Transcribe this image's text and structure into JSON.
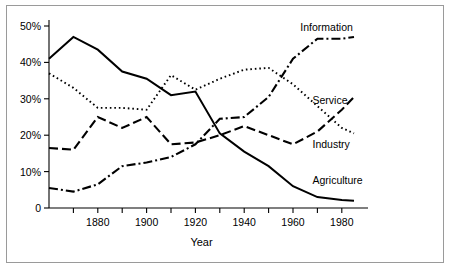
{
  "figure": {
    "border_color": "#9a9a9a",
    "background": "#ffffff"
  },
  "chart_data": {
    "type": "line",
    "title": "",
    "subtitle": "",
    "xlabel": "Year",
    "ylabel": "",
    "xlim": [
      1860,
      1985
    ],
    "ylim": [
      0,
      50
    ],
    "grid": false,
    "legend_position": "right-inline-labels",
    "x": [
      1860,
      1870,
      1880,
      1890,
      1900,
      1910,
      1920,
      1930,
      1940,
      1950,
      1960,
      1970,
      1980,
      1985
    ],
    "xticks": [
      1880,
      1900,
      1920,
      1940,
      1960,
      1980
    ],
    "xtick_labels": [
      "1880",
      "1900",
      "1920",
      "1940",
      "1960",
      "1980"
    ],
    "xminor_tick_interval": 10,
    "yticks": [
      0,
      10,
      20,
      30,
      40,
      50
    ],
    "ytick_labels": [
      "0",
      "10%",
      "20%",
      "30%",
      "40%",
      "50%"
    ],
    "series": [
      {
        "name": "Agriculture",
        "label": "Agriculture",
        "line_style": "solid",
        "color": "#000000",
        "line_width": 2.0,
        "label_x": 1968,
        "label_y": 6.5,
        "values": [
          41.0,
          47.0,
          43.5,
          37.5,
          35.5,
          31.0,
          32.0,
          20.5,
          15.5,
          11.5,
          6.0,
          3.0,
          2.2,
          2.0
        ]
      },
      {
        "name": "Industry",
        "label": "Industry",
        "line_style": "dotted",
        "color": "#000000",
        "line_width": 1.9,
        "label_x": 1968,
        "label_y": 16.5,
        "values": [
          37.0,
          33.0,
          27.5,
          27.5,
          27.0,
          36.5,
          32.5,
          35.5,
          38.0,
          38.5,
          34.0,
          28.0,
          22.0,
          20.5
        ]
      },
      {
        "name": "Service",
        "label": "Service",
        "line_style": "dashed",
        "color": "#000000",
        "line_width": 2.1,
        "label_x": 1968,
        "label_y": 28.5,
        "values": [
          16.5,
          16.0,
          25.0,
          22.0,
          25.0,
          17.5,
          18.0,
          20.0,
          22.5,
          20.0,
          17.5,
          21.0,
          27.0,
          30.5
        ]
      },
      {
        "name": "Information",
        "label": "Information",
        "line_style": "dashdot",
        "color": "#000000",
        "line_width": 2.1,
        "label_x": 1963,
        "label_y": 48.5,
        "values": [
          5.5,
          4.5,
          6.5,
          11.5,
          12.5,
          14.0,
          17.5,
          24.5,
          25.0,
          30.5,
          41.0,
          46.5,
          46.5,
          47.0
        ]
      }
    ]
  }
}
